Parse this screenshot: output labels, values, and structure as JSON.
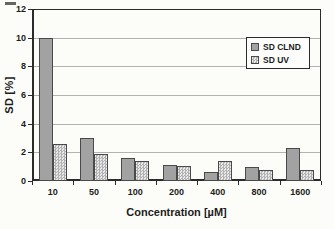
{
  "chart_data": {
    "type": "bar",
    "title": "",
    "categories": [
      "10",
      "50",
      "100",
      "200",
      "400",
      "800",
      "1600"
    ],
    "series": [
      {
        "name": "SD CLND",
        "style": "solid-gray",
        "values": [
          10.0,
          3.0,
          1.6,
          1.15,
          0.65,
          1.0,
          2.3
        ]
      },
      {
        "name": "SD UV",
        "style": "checkered",
        "values": [
          2.6,
          1.9,
          1.4,
          1.05,
          1.4,
          0.8,
          0.8
        ]
      }
    ],
    "xlabel": "Concentration [µM]",
    "ylabel": "SD [%]",
    "ylim": [
      0,
      12
    ],
    "yticks": [
      0,
      2,
      4,
      6,
      8,
      10,
      12
    ],
    "grid": true,
    "legend_position": "upper-right"
  },
  "colors": {
    "background": "#fcfcf9",
    "clnd_bar": "#a2a2a2",
    "uv_bar_dark": "#b2b2b2",
    "uv_bar_light": "#e9e9e9",
    "bar_border": "#4a4a4a",
    "gridline": "#b2b2b2",
    "axis": "#2b2b2b",
    "text": "#1c1c1c"
  }
}
